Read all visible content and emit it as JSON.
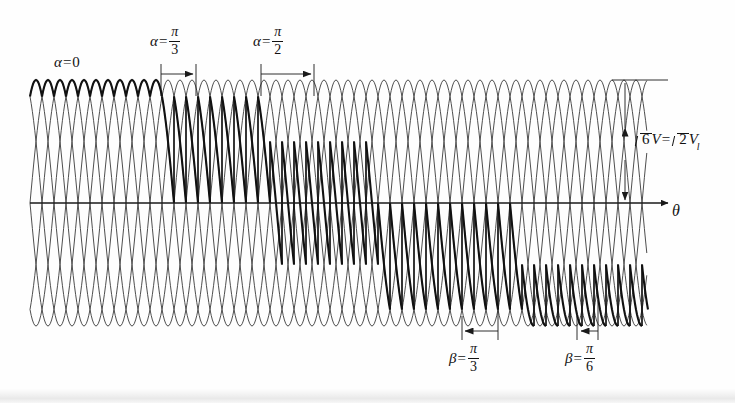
{
  "figure": {
    "kind": "six-pulse-converter-output-voltage-waveform",
    "background": "#fefefe",
    "ink": "#1a1a1a"
  },
  "labels": {
    "alpha_zero": {
      "var": "α",
      "eq": "=",
      "value": "0"
    },
    "alpha_pi_3": {
      "var": "α",
      "eq": "=",
      "num": "π",
      "den": "3"
    },
    "alpha_pi_2": {
      "var": "α",
      "eq": "=",
      "num": "π",
      "den": "2"
    },
    "beta_pi_3": {
      "var": "β",
      "eq": "=",
      "num": "π",
      "den": "3"
    },
    "beta_pi_6": {
      "var": "β",
      "eq": "=",
      "num": "π",
      "den": "6"
    },
    "amplitude": {
      "root1": "6",
      "v1": "V",
      "eq": "=",
      "root2": "2",
      "v2": "V",
      "v2sub": "l"
    },
    "axis_x": {
      "text": "θ"
    }
  },
  "axes": {
    "x_axis": {
      "y": 203,
      "x_start": 30,
      "x_end": 676,
      "arrow": true
    },
    "amplitude_dimension": {
      "x": 625,
      "y_top": 80,
      "y_bottom": 203,
      "tick_x_end": 668
    }
  },
  "chart_data": {
    "type": "line",
    "title": "",
    "xlabel": "θ",
    "ylabel": "",
    "grid": false,
    "legend": null,
    "peak_y_px": 80,
    "trough_y_px": 325,
    "baseline_y_px": 203,
    "plot_x_start_px": 30,
    "plot_x_end_px": 648,
    "amplitude_label": "√6 V = √2 Vl",
    "phase_count": 6,
    "pulses_per_cycle": 6,
    "half_cycle_px": 36,
    "series": [
      {
        "name": "phase-sinusoid-1",
        "phase_deg": 0,
        "style": "thin"
      },
      {
        "name": "phase-sinusoid-2",
        "phase_deg": 60,
        "style": "thin"
      },
      {
        "name": "phase-sinusoid-3",
        "phase_deg": 120,
        "style": "thin"
      },
      {
        "name": "phase-sinusoid-4",
        "phase_deg": 180,
        "style": "thin"
      },
      {
        "name": "phase-sinusoid-5",
        "phase_deg": 240,
        "style": "thin"
      },
      {
        "name": "phase-sinusoid-6",
        "phase_deg": 300,
        "style": "thin"
      },
      {
        "name": "output-voltage-envelope",
        "style": "bold"
      }
    ],
    "firing_angle_regions": [
      {
        "label": "α = 0",
        "alpha_deg": 0,
        "x_start_px": 30,
        "x_end_px": 160
      },
      {
        "label": "α = π/3",
        "alpha_deg": 60,
        "x_start_px": 160,
        "x_end_px": 268
      },
      {
        "label": "α = π/2",
        "alpha_deg": 90,
        "x_start_px": 268,
        "x_end_px": 376
      },
      {
        "label": "β = π/3",
        "beta_deg": 60,
        "x_start_px": 376,
        "x_end_px": 520
      },
      {
        "label": "β = π/6",
        "beta_deg": 30,
        "x_start_px": 520,
        "x_end_px": 648
      }
    ],
    "dimension_arrows": [
      {
        "name": "alpha-pi-3-arrow",
        "x_from": 161,
        "x_to": 193,
        "y": 74,
        "direction": "right"
      },
      {
        "name": "alpha-pi-2-arrow",
        "x_from": 261,
        "x_to": 311,
        "y": 74,
        "direction": "right"
      },
      {
        "name": "beta-pi-3-arrow",
        "x_from": 496,
        "x_to": 462,
        "y": 331,
        "direction": "left"
      },
      {
        "name": "beta-pi-6-arrow",
        "x_from": 596,
        "x_to": 578,
        "y": 331,
        "direction": "left"
      }
    ]
  }
}
